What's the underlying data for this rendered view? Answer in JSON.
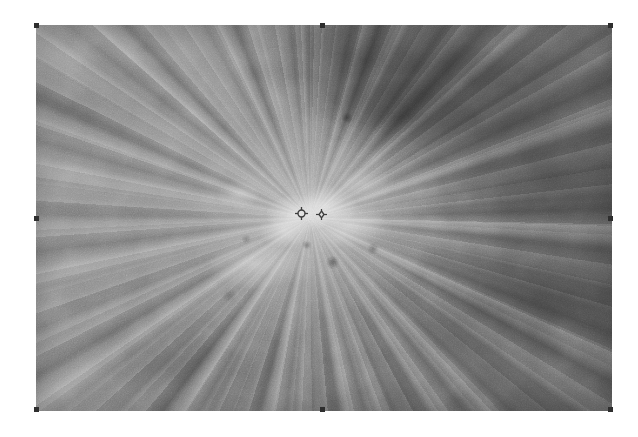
{
  "document": {
    "background_color": "#ffffff",
    "canvas_width": 638,
    "canvas_height": 437
  },
  "image_object": {
    "name": "solar-penumbra-image",
    "alt_text": "Grayscale close-up of a sunspot penumbra showing radial filamentary structure",
    "frame": {
      "x": 36,
      "y": 25,
      "width": 576,
      "height": 386
    },
    "selected": true,
    "appearance": {
      "color_mode": "grayscale",
      "base_gray": "#8d8d8d",
      "brightest_gray": "#f0f0f0",
      "darkest_gray": "#222222",
      "structure": "radial filaments converging on a bright core",
      "core_center_x_pct": 47.6,
      "core_center_y_pct": 50.0,
      "dark_wedge_region": "upper-right"
    }
  },
  "markers": [
    {
      "label": "marker-primary",
      "glyph": "crosshair-circle-icon",
      "x": 301,
      "y": 213,
      "size": 11,
      "color": "#3a3a3a"
    },
    {
      "label": "marker-secondary",
      "glyph": "crosshair-diamond-icon",
      "x": 321,
      "y": 214,
      "size": 9,
      "color": "#3a3a3a"
    }
  ],
  "selection_handles": [
    {
      "position": "nw",
      "label": "resize-handle-top-left"
    },
    {
      "position": "n",
      "label": "resize-handle-top-center"
    },
    {
      "position": "ne",
      "label": "resize-handle-top-right"
    },
    {
      "position": "w",
      "label": "resize-handle-middle-left"
    },
    {
      "position": "e",
      "label": "resize-handle-middle-right"
    },
    {
      "position": "sw",
      "label": "resize-handle-bottom-left"
    },
    {
      "position": "s",
      "label": "resize-handle-bottom-center"
    },
    {
      "position": "se",
      "label": "resize-handle-bottom-right"
    }
  ]
}
